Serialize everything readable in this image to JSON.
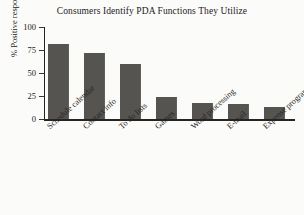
{
  "chart_data": {
    "type": "bar",
    "title": "Consumers Identify PDA Functions They Utilize",
    "xlabel": "",
    "ylabel": "% Positive responses",
    "categories": [
      "Schedule calendar",
      "Contact info",
      "To do lists",
      "Games",
      "Word processing",
      "E-mail",
      "Expense programs"
    ],
    "values": [
      81,
      72,
      60,
      24,
      17,
      16,
      13
    ],
    "ylim": [
      0,
      100
    ],
    "yticks": [
      0,
      25,
      50,
      75,
      100
    ],
    "ytick_labels": [
      "0",
      "25",
      "50",
      "75",
      "100"
    ],
    "grid": false,
    "legend": null,
    "bar_color": "#565451",
    "background_color": "#fbfbf9",
    "axis_color": "#262423"
  },
  "figure": {
    "title": "Consumers Identify PDA Functions They Utilize",
    "y_axis_title": "% Positive responses"
  }
}
